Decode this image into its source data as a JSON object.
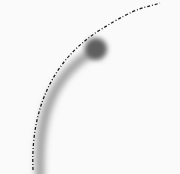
{
  "scene": {
    "background_color": "#fafafa",
    "stroke_color": "#9a9a9a",
    "knob_color": "#5a5a5a",
    "dashed_arc_color": "#1a1a1a",
    "elements": [
      {
        "name": "blurred-curved-stroke",
        "shape": "arc-stroke"
      },
      {
        "name": "blurred-knob",
        "shape": "circle"
      },
      {
        "name": "dashed-arc",
        "shape": "dashed-curve"
      }
    ]
  }
}
